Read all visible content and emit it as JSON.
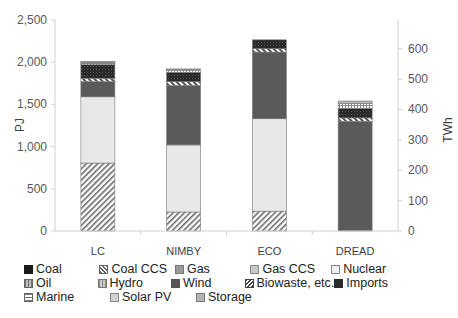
{
  "chart_data": {
    "type": "bar",
    "stacked": true,
    "title": "",
    "xlabel": "",
    "ylabel": "PJ",
    "y2label": "TWh",
    "ylim": [
      0,
      2500
    ],
    "y2lim": [
      0,
      694
    ],
    "yticks": [
      "0",
      "500",
      "1,000",
      "1,500",
      "2,000",
      "2,500"
    ],
    "y2ticks": [
      "0",
      "100",
      "200",
      "300",
      "400",
      "500",
      "600"
    ],
    "categories": [
      "LC",
      "NIMBY",
      "ECO",
      "DREAD"
    ],
    "series": [
      {
        "name": "Coal",
        "values": [
          0,
          0,
          0,
          0
        ]
      },
      {
        "name": "Coal CCS",
        "values": [
          805,
          225,
          235,
          0
        ]
      },
      {
        "name": "Gas",
        "values": [
          0,
          0,
          0,
          0
        ]
      },
      {
        "name": "Gas CCS",
        "values": [
          0,
          0,
          0,
          0
        ]
      },
      {
        "name": "Nuclear",
        "values": [
          785,
          795,
          1095,
          0
        ]
      },
      {
        "name": "Oil",
        "values": [
          0,
          0,
          0,
          0
        ]
      },
      {
        "name": "Hydro",
        "values": [
          0,
          0,
          0,
          0
        ]
      },
      {
        "name": "Wind",
        "values": [
          180,
          705,
          790,
          1300
        ]
      },
      {
        "name": "Biowaste, etc.",
        "values": [
          40,
          45,
          40,
          40
        ]
      },
      {
        "name": "Imports",
        "values": [
          160,
          110,
          105,
          110
        ]
      },
      {
        "name": "Marine",
        "values": [
          20,
          20,
          0,
          60
        ]
      },
      {
        "name": "Solar PV",
        "values": [
          10,
          10,
          0,
          0
        ]
      },
      {
        "name": "Storage",
        "values": [
          10,
          10,
          0,
          30
        ]
      }
    ],
    "totals": [
      2010,
      1920,
      2265,
      1540
    ],
    "grid": false,
    "legend_position": "bottom"
  },
  "legend": {
    "rows": [
      [
        "Coal",
        "Coal CCS",
        "Gas",
        "Gas CCS",
        "Nuclear"
      ],
      [
        "Oil",
        "Hydro",
        "Wind",
        "Biowaste, etc.",
        "Imports"
      ],
      [
        "Marine",
        "Solar PV",
        "Storage"
      ]
    ]
  },
  "colors": {
    "Coal": "#1a1a1a",
    "Coal CCS": "#8a8a8a",
    "Gas": "#9a9a9a",
    "Gas CCS": "#c8c8c8",
    "Nuclear": "#e6e6e6",
    "Oil": "#9c9c9c",
    "Hydro": "#a8a8a8",
    "Wind": "#555555",
    "Biowaste, etc.": "#5a5a5a",
    "Imports": "#2a2a2a",
    "Marine": "#bdbdbd",
    "Solar PV": "#cfcfcf",
    "Storage": "#b0b0b0"
  }
}
